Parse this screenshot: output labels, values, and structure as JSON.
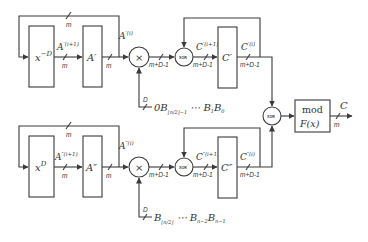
{
  "diagram": {
    "type": "block-diagram",
    "colors": {
      "stroke": "#3a3a3a",
      "text": "#333333",
      "background": "#ffffff"
    },
    "top_path": {
      "shift_block": {
        "label": "x",
        "sup": "−D"
      },
      "register_a": {
        "label": "A′"
      },
      "a_next_label": {
        "base": "A",
        "sup": "′(i+1)"
      },
      "a_curr_label": {
        "base": "A",
        "sup": "′(i)"
      },
      "multiplier": {
        "symbol": "×"
      },
      "xor": {
        "label": "XOR"
      },
      "c_next_label": {
        "base": "C",
        "sup": "′(i+1)"
      },
      "register_c": {
        "label": "C′"
      },
      "c_curr_label": {
        "base": "C",
        "sup": "′(i)"
      },
      "b_input": {
        "prefix": "0B",
        "sub": "⌊n/2⌋−1",
        "rest": " ⋯ B",
        "sub2": "1",
        "rest2": "B",
        "sub3": "0"
      },
      "b_width": "D",
      "widths": {
        "loop": "m",
        "a_next": "m",
        "a_curr": "m",
        "mult_out": "m+D-1",
        "xor_out": "m+D-1",
        "c_out": "m+D-1"
      }
    },
    "bottom_path": {
      "shift_block": {
        "label": "x",
        "sup": "D"
      },
      "register_a": {
        "label": "A″"
      },
      "a_next_label": {
        "base": "A",
        "sup": "″(i+1)"
      },
      "a_curr_label": {
        "base": "A",
        "sup": "″(i)"
      },
      "multiplier": {
        "symbol": "×"
      },
      "xor": {
        "label": "XOR"
      },
      "c_next_label": {
        "base": "C",
        "sup": "″(i+1)"
      },
      "register_c": {
        "label": "C″"
      },
      "c_curr_label": {
        "base": "C",
        "sup": "″(i)"
      },
      "b_input": {
        "prefix": "B",
        "sub": "⌊n/2⌋",
        "rest": " ⋯ B",
        "sub2": "n−2",
        "rest2": "B",
        "sub3": "n−1"
      },
      "b_width": "D",
      "widths": {
        "loop": "m",
        "a_next": "m",
        "a_curr": "m",
        "mult_out": "m+D-1",
        "xor_out": "m+D-1",
        "c_out": "m+D-1"
      }
    },
    "final": {
      "xor": {
        "label": "XOR"
      },
      "mod_block": {
        "line1": "mod",
        "line2": "F(x)"
      },
      "output": {
        "label": "C",
        "width": "m"
      }
    }
  }
}
